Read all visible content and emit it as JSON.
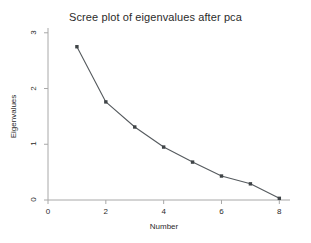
{
  "chart_data": {
    "type": "line",
    "title": "Scree plot of eigenvalues after pca",
    "xlabel": "Number",
    "ylabel": "Eigenvalues",
    "x": [
      1,
      2,
      3,
      4,
      5,
      6,
      7,
      8
    ],
    "values": [
      2.75,
      1.76,
      1.31,
      0.95,
      0.68,
      0.43,
      0.29,
      0.03
    ],
    "series": [
      {
        "name": "Eigenvalues",
        "values": [
          2.75,
          1.76,
          1.31,
          0.95,
          0.68,
          0.43,
          0.29,
          0.03
        ]
      }
    ],
    "xlim": [
      0,
      8.3
    ],
    "ylim": [
      0,
      3.05
    ],
    "xticks": [
      0,
      2,
      4,
      6,
      8
    ],
    "xtick_labels": [
      "0",
      "2",
      "4",
      "6",
      "8"
    ],
    "yticks": [
      0,
      1,
      2,
      3
    ],
    "ytick_labels": [
      "0",
      "1",
      "2",
      "3"
    ],
    "grid": false,
    "legend": false,
    "marker": "square",
    "line_color": "#555a5e",
    "marker_color": "#3f4447",
    "axis_color": "#a8a8a8",
    "text_color": "#2b2b2b",
    "background": "#ffffff",
    "plot_background": "#ffffff"
  }
}
